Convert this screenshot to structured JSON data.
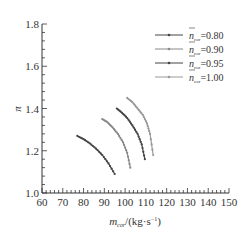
{
  "chart_data": {
    "type": "line",
    "title": "",
    "xlabel": "m_cor/(kg·s⁻¹)",
    "ylabel": "π",
    "xlim": [
      60,
      150
    ],
    "ylim": [
      1.0,
      1.8
    ],
    "xticks": [
      60,
      70,
      80,
      90,
      100,
      110,
      120,
      130,
      140,
      150
    ],
    "yticks": [
      1.0,
      1.2,
      1.4,
      1.6,
      1.8
    ],
    "grid": false,
    "legend_position": "upper right",
    "series": [
      {
        "name": "n̄cor=0.80",
        "color": "#444444",
        "x": [
          77,
          80,
          83,
          86,
          89,
          92,
          95
        ],
        "y": [
          1.27,
          1.255,
          1.235,
          1.21,
          1.18,
          1.14,
          1.09
        ]
      },
      {
        "name": "n̄cor=0.90",
        "color": "#888888",
        "x": [
          89,
          91.5,
          94,
          96.5,
          99,
          101,
          102.5
        ],
        "y": [
          1.35,
          1.335,
          1.31,
          1.28,
          1.24,
          1.19,
          1.12
        ]
      },
      {
        "name": "n̄cor=0.95",
        "color": "#444444",
        "x": [
          96,
          98.5,
          101,
          103.5,
          106,
          108,
          109.5
        ],
        "y": [
          1.4,
          1.38,
          1.355,
          1.32,
          1.28,
          1.23,
          1.16
        ]
      },
      {
        "name": "n̄cor=1.00",
        "color": "#999999",
        "x": [
          101,
          103.5,
          106,
          108.5,
          110.5,
          112,
          113.5
        ],
        "y": [
          1.45,
          1.43,
          1.4,
          1.37,
          1.33,
          1.28,
          1.18
        ]
      }
    ]
  },
  "legend": {
    "items": [
      {
        "sym": "n",
        "sub": "cor",
        "value": "=0.80"
      },
      {
        "sym": "n",
        "sub": "cor",
        "value": "=0.90"
      },
      {
        "sym": "n",
        "sub": "cor",
        "value": "=0.95"
      },
      {
        "sym": "n",
        "sub": "cor",
        "value": "=1.00"
      }
    ]
  },
  "axes": {
    "x_label_main": "m",
    "x_label_sub": "cor",
    "x_label_unit": "/(kg·s",
    "x_label_exp": "−1",
    "x_label_close": ")",
    "y_label": "π"
  }
}
